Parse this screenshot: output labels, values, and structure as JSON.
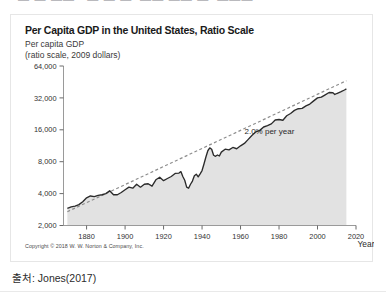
{
  "top_strip": {
    "clipped_text": "▬ ▬ ▬▬   ▬ ▬ ▬  ▬▬ ▬▬ ▬  ▬▬▬"
  },
  "figure": {
    "title": "Per Capita GDP in the United States, Ratio Scale",
    "y_axis_caption_line1": "Per capita GDP",
    "y_axis_caption_line2": "(ratio scale, 2009 dollars)",
    "copyright": "Copyright © 2018 W. W. Norton & Company, Inc."
  },
  "caption": {
    "text": "출처: Jones(2017)"
  },
  "colors": {
    "series_line": "#2b2b2b",
    "area_fill": "#e2e2e2",
    "trend_line": "#8d8d8d",
    "axis": "#9a9a9a",
    "card_border": "#e6e6e6",
    "text": "#1a1a1a"
  },
  "chart_data": {
    "type": "line",
    "title": "Per Capita GDP in the United States, Ratio Scale",
    "subtitle": "Per capita GDP (ratio scale, 2009 dollars)",
    "xlabel": "Year",
    "ylabel": "Per capita GDP (ratio scale, 2009 dollars)",
    "yscale": "log",
    "ylim": [
      2000,
      64000
    ],
    "xlim": [
      1868,
      2020
    ],
    "grid": false,
    "legend": false,
    "ytick_labels": [
      "64,000",
      "32,000",
      "16,000",
      "8,000",
      "4,000",
      "2,000"
    ],
    "ytick_values": [
      64000,
      32000,
      16000,
      8000,
      4000,
      2000
    ],
    "xtick_labels": [
      "1880",
      "1900",
      "1920",
      "1940",
      "1960",
      "1980",
      "2000",
      "2020"
    ],
    "xtick_values": [
      1880,
      1900,
      1920,
      1940,
      1960,
      1980,
      2000,
      2020
    ],
    "annotations": [
      {
        "text": "2.0% per year",
        "x": 1975,
        "y": 14500
      }
    ],
    "series": [
      {
        "name": "Per capita GDP",
        "style": "solid-with-area-fill",
        "x": [
          1870,
          1872,
          1874,
          1876,
          1878,
          1880,
          1882,
          1884,
          1886,
          1888,
          1890,
          1892,
          1894,
          1896,
          1898,
          1900,
          1902,
          1904,
          1906,
          1908,
          1910,
          1912,
          1914,
          1916,
          1918,
          1920,
          1922,
          1924,
          1926,
          1928,
          1929,
          1930,
          1931,
          1932,
          1933,
          1934,
          1935,
          1936,
          1937,
          1938,
          1939,
          1940,
          1941,
          1942,
          1943,
          1944,
          1945,
          1946,
          1947,
          1948,
          1949,
          1950,
          1952,
          1954,
          1956,
          1958,
          1960,
          1962,
          1964,
          1966,
          1968,
          1970,
          1972,
          1974,
          1976,
          1978,
          1980,
          1982,
          1984,
          1986,
          1988,
          1990,
          1992,
          1994,
          1996,
          1998,
          2000,
          2002,
          2004,
          2006,
          2008,
          2009,
          2010,
          2012,
          2014,
          2015
        ],
        "values": [
          2900,
          3000,
          3050,
          3150,
          3350,
          3650,
          3800,
          3750,
          3850,
          3900,
          4000,
          4250,
          3900,
          3900,
          4100,
          4350,
          4600,
          4500,
          4900,
          4600,
          4900,
          4950,
          4700,
          5400,
          5700,
          5300,
          5550,
          5800,
          6200,
          6250,
          6450,
          5800,
          5350,
          4600,
          4500,
          4900,
          5250,
          5900,
          6100,
          5750,
          6150,
          6600,
          7600,
          8850,
          10150,
          10800,
          10500,
          9200,
          9000,
          9250,
          9050,
          9850,
          10500,
          10350,
          10900,
          10600,
          11300,
          11900,
          13000,
          14200,
          15300,
          15800,
          17000,
          17500,
          18200,
          19800,
          20000,
          19700,
          21700,
          22800,
          24400,
          25300,
          25500,
          26900,
          28000,
          30000,
          32000,
          32500,
          34200,
          36000,
          35800,
          34500,
          35200,
          36500,
          38000,
          38900
        ]
      },
      {
        "name": "2.0% per year trend",
        "style": "dashed",
        "x": [
          1870,
          2015
        ],
        "values": [
          2700,
          46500
        ]
      }
    ]
  }
}
